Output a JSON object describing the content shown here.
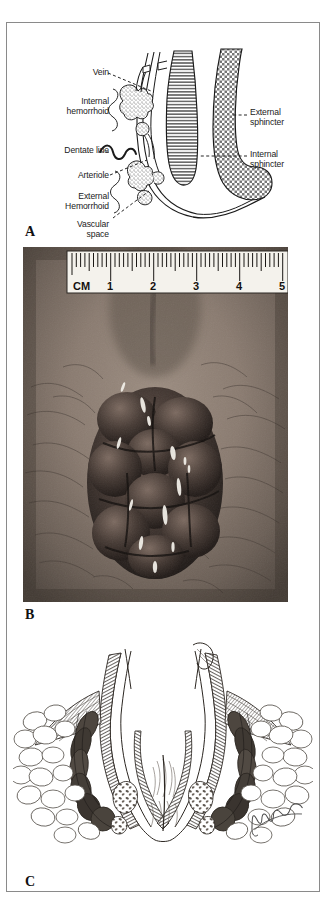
{
  "figure": {
    "panels": [
      {
        "id": "A",
        "letter": "A",
        "type": "line-diagram",
        "description": "Sagittal line diagram of anal canal showing hemorrhoidal anatomy",
        "labels": {
          "vein": "Vein",
          "internal_hemorrhoid": "Internal\nhemorrhoid",
          "dentate_line": "Dentate line",
          "arteriole": "Arteriole",
          "external_hemorrhoid": "External\nHemorrhoid",
          "vascular_space": "Vascular\nspace",
          "external_sphincter": "External\nsphincter",
          "internal_sphincter": "Internal\nsphincter"
        }
      },
      {
        "id": "B",
        "letter": "B",
        "type": "photograph",
        "description": "Clinical photograph of prolapsed thrombosed hemorrhoids with a ruler for scale",
        "ruler": {
          "unit_label": "CM",
          "ticks": [
            "1",
            "2",
            "3",
            "4",
            "5"
          ]
        }
      },
      {
        "id": "C",
        "letter": "C",
        "type": "line-drawing",
        "description": "Coronal artist rendering of the anal canal with internal and external hemorrhoidal plexus",
        "signature": "artist-signature"
      }
    ]
  },
  "colors": {
    "frame": "#8a8a8a",
    "ink": "#1a1a1a",
    "paper": "#ffffff",
    "photo_dark": "#3a332e",
    "photo_skin": "#8f8177"
  }
}
